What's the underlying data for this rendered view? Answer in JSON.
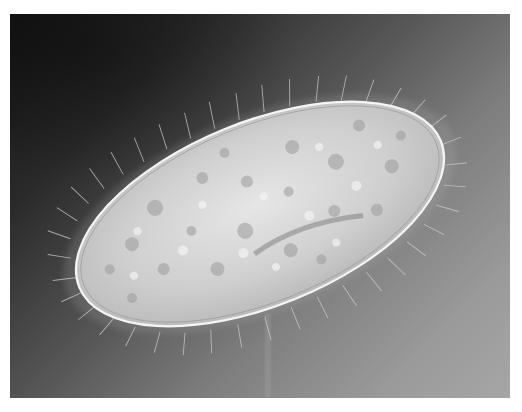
{
  "image": {
    "subject": "Paramecium (ciliated protozoan) under light microscopy",
    "alt": "Micrograph of an oval, ciliated paramecium cell with granular cytoplasm and food vacuoles against a dark-to-light gray gradient background",
    "style": "grayscale micrograph",
    "colors": {
      "page_background": "#ffffff",
      "background_dark": "#151515",
      "background_light": "#a4a4a4",
      "cell_body": "#d8d8d8",
      "cell_highlight": "#f2f2f2",
      "cilia": "#c8c8c8"
    },
    "frame": {
      "left": 10,
      "top": 14,
      "width": 500,
      "height": 384
    }
  }
}
